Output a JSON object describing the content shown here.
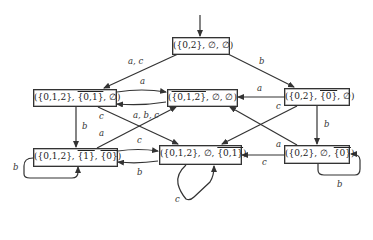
{
  "diagram": {
    "type": "state-automaton",
    "initial_state": "s0",
    "nodes": [
      {
        "id": "s0",
        "label": "({0,2}, ∅, ∅)",
        "parts": [
          "({0,2}, ∅, ∅)"
        ]
      },
      {
        "id": "s1",
        "label": "({0,1,2}, {0,1}‾, ∅)",
        "pre": "({0,1,2}, ",
        "over": "{0,1}",
        "post": ", ∅)"
      },
      {
        "id": "s2",
        "label": "({0,1,2}‾, ∅, ∅)",
        "pre": "(",
        "over": "{0,1,2}",
        "post": ", ∅, ∅)"
      },
      {
        "id": "s3",
        "label": "({0,2}, {0}‾, ∅)",
        "pre": "({0,2}, ",
        "over": "{0}",
        "post": ", ∅)"
      },
      {
        "id": "s4",
        "label": "({0,1,2}, {1}‾, {0}‾)",
        "pre": "({0,1,2}, ",
        "over": "{1}",
        "mid": ", ",
        "over2": "{0}",
        "post": ")"
      },
      {
        "id": "s5",
        "label": "({0,1,2}, ∅, {0,1}‾)",
        "pre": "({0,1,2}, ∅, ",
        "over": "{0,1}",
        "post": ")"
      },
      {
        "id": "s6",
        "label": "({0,2}, ∅, {0}‾)",
        "pre": "({0,2}, ∅, ",
        "over": "{0}",
        "post": ")"
      }
    ],
    "edges": [
      {
        "from": "s0",
        "to": "s1",
        "label": "a, c"
      },
      {
        "from": "s0",
        "to": "s3",
        "label": "b"
      },
      {
        "from": "s1",
        "to": "s2",
        "label": "a"
      },
      {
        "from": "s2",
        "to": "s1",
        "label": ""
      },
      {
        "from": "s3",
        "to": "s2",
        "label": "a"
      },
      {
        "from": "s1",
        "to": "s4",
        "label": "b"
      },
      {
        "from": "s1",
        "to": "s5",
        "label": "c"
      },
      {
        "from": "s4",
        "to": "s2",
        "label": "a"
      },
      {
        "from": "s4",
        "to": "s2",
        "label_shared": "a, b, c"
      },
      {
        "from": "s3",
        "to": "s5",
        "label": "c"
      },
      {
        "from": "s3",
        "to": "s6",
        "label": "b"
      },
      {
        "from": "s6",
        "to": "s2",
        "label": "a"
      },
      {
        "from": "s4",
        "to": "s5",
        "label": "c"
      },
      {
        "from": "s5",
        "to": "s4",
        "label": "b"
      },
      {
        "from": "s6",
        "to": "s5",
        "label": "c"
      },
      {
        "from": "s4",
        "to": "s4",
        "label": "b"
      },
      {
        "from": "s5",
        "to": "s5",
        "label": "c"
      },
      {
        "from": "s6",
        "to": "s6",
        "label": "b"
      }
    ],
    "edge_labels": {
      "s0_s1": "a, c",
      "s0_s3": "b",
      "s1_s2": "a",
      "s3_s2": "a",
      "s1_s4": "b",
      "s1_s5": "c",
      "abc": "a, b, c",
      "s4_s2": "a",
      "s4_s5": "c",
      "s5_s4": "b",
      "s3_s5": "c",
      "s3_s6": "b",
      "s6_s2": "a",
      "s6_s5": "c",
      "s4_loop": "b",
      "s5_loop": "c",
      "s6_loop": "b"
    }
  }
}
